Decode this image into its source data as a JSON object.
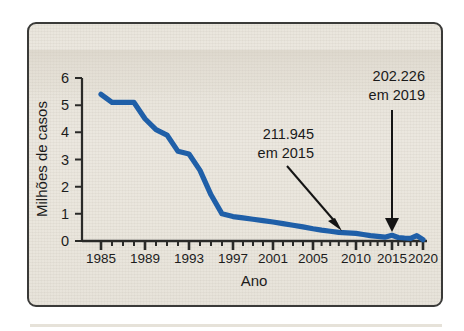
{
  "figure": {
    "background_color": "#eae6dd",
    "border_color": "#3a3a38",
    "line_color": "#1f5fa8",
    "text_color": "#1a1a1a"
  },
  "chart_data": {
    "type": "line",
    "title": "",
    "xlabel": "Ano",
    "ylabel": "Milhões de casos",
    "xlim": [
      1985,
      2020
    ],
    "ylim": [
      0,
      6
    ],
    "grid": false,
    "legend": null,
    "x_tick_labels": [
      "1985",
      "1989",
      "1993",
      "1997",
      "2001",
      "2005",
      "2010",
      "2015",
      "2020"
    ],
    "x_tick_values": [
      1985,
      1989,
      1993,
      1997,
      2001,
      2005,
      2010,
      2015,
      2020
    ],
    "y_tick_labels": [
      "0",
      "1",
      "2",
      "3",
      "4",
      "5",
      "6"
    ],
    "y_tick_values": [
      0,
      1,
      2,
      3,
      4,
      5,
      6
    ],
    "minor_x_ticks_every": 1,
    "series": [
      {
        "name": "Casos de sarampo",
        "color": "#1f5fa8",
        "x": [
          1985,
          1986,
          1987,
          1988,
          1989,
          1990,
          1991,
          1992,
          1993,
          1994,
          1995,
          1996,
          1997,
          1998,
          1999,
          2000,
          2001,
          2002,
          2003,
          2004,
          2005,
          2006,
          2007,
          2008,
          2009,
          2010,
          2011,
          2012,
          2013,
          2014,
          2015,
          2016,
          2017,
          2018,
          2019,
          2020
        ],
        "values": [
          5.4,
          5.1,
          5.1,
          5.1,
          4.5,
          4.1,
          3.9,
          3.3,
          3.2,
          2.6,
          1.7,
          1.0,
          0.9,
          0.85,
          0.8,
          0.75,
          0.7,
          0.64,
          0.58,
          0.52,
          0.45,
          0.4,
          0.36,
          0.32,
          0.3,
          0.28,
          0.24,
          0.2,
          0.17,
          0.14,
          0.21,
          0.13,
          0.11,
          0.1,
          0.2,
          0.05
        ]
      }
    ],
    "annotations": [
      {
        "id": "annot-2015",
        "line1": "211.945",
        "line2": "em 2015",
        "target_year": 2015,
        "arrow": "diagonal-down-right"
      },
      {
        "id": "annot-2019",
        "line1": "202.226",
        "line2": "em 2019",
        "target_year": 2019,
        "arrow": "vertical-down"
      }
    ]
  }
}
